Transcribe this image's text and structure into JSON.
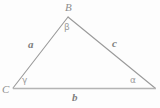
{
  "figure": {
    "type": "geometry-diagram",
    "shape": "triangle",
    "canvas": {
      "width": 160,
      "height": 108,
      "background": "#fdfdfd"
    },
    "stroke_color": "#9a9a9a",
    "baseline_color": "#b4b4b4",
    "text_color": "#8a8a8a",
    "vertices": [
      {
        "name": "B",
        "label": "B",
        "x": 68,
        "y": 17
      },
      {
        "name": "C",
        "label": "C",
        "x": 13,
        "y": 88
      },
      {
        "name": "A",
        "label": "",
        "x": 155,
        "y": 88
      }
    ],
    "sides": [
      {
        "name": "a",
        "label": "a",
        "from": "C",
        "to": "B"
      },
      {
        "name": "b",
        "label": "b",
        "from": "C",
        "to": "A"
      },
      {
        "name": "c",
        "label": "c",
        "from": "B",
        "to": "A"
      }
    ],
    "angles": [
      {
        "name": "beta",
        "label": "β",
        "at": "B"
      },
      {
        "name": "gamma",
        "label": "γ",
        "at": "C"
      },
      {
        "name": "alpha",
        "label": "α",
        "at": "A"
      }
    ]
  }
}
